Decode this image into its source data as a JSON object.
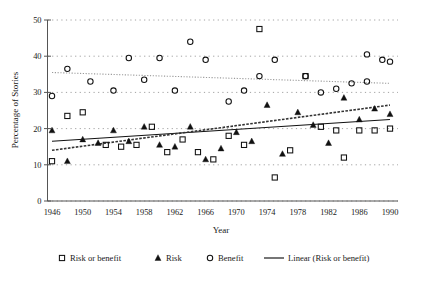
{
  "chart_data": {
    "type": "scatter",
    "title": "",
    "xlabel": "Year",
    "ylabel": "Percentage of Stories",
    "xlim": [
      1945,
      1991
    ],
    "ylim": [
      0,
      50
    ],
    "xticks": [
      1946,
      1950,
      1954,
      1958,
      1962,
      1966,
      1970,
      1974,
      1978,
      1982,
      1986,
      1990
    ],
    "yticks": [
      0,
      10,
      20,
      30,
      40,
      50
    ],
    "grid": true,
    "legend_position": "bottom",
    "series": [
      {
        "name": "Risk or benefit",
        "marker": "open-square",
        "points": [
          [
            1946,
            11.0
          ],
          [
            1948,
            23.5
          ],
          [
            1950,
            24.5
          ],
          [
            1953,
            15.5
          ],
          [
            1955,
            15.0
          ],
          [
            1957,
            15.5
          ],
          [
            1959,
            20.5
          ],
          [
            1961,
            13.5
          ],
          [
            1963,
            17.0
          ],
          [
            1965,
            13.5
          ],
          [
            1967,
            11.5
          ],
          [
            1969,
            18.0
          ],
          [
            1971,
            15.5
          ],
          [
            1973,
            47.5
          ],
          [
            1975,
            6.5
          ],
          [
            1977,
            14.0
          ],
          [
            1979,
            34.5
          ],
          [
            1981,
            20.5
          ],
          [
            1983,
            19.5
          ],
          [
            1984,
            12.0
          ],
          [
            1986,
            19.5
          ],
          [
            1988,
            19.5
          ],
          [
            1990,
            20.0
          ]
        ]
      },
      {
        "name": "Risk",
        "marker": "filled-triangle",
        "points": [
          [
            1946,
            19.5
          ],
          [
            1948,
            11.0
          ],
          [
            1950,
            17.0
          ],
          [
            1952,
            16.0
          ],
          [
            1954,
            19.5
          ],
          [
            1956,
            16.5
          ],
          [
            1958,
            20.5
          ],
          [
            1960,
            15.5
          ],
          [
            1962,
            15.0
          ],
          [
            1964,
            20.5
          ],
          [
            1966,
            11.5
          ],
          [
            1968,
            14.5
          ],
          [
            1970,
            19.0
          ],
          [
            1972,
            16.5
          ],
          [
            1974,
            26.5
          ],
          [
            1976,
            13.0
          ],
          [
            1978,
            24.5
          ],
          [
            1980,
            21.0
          ],
          [
            1982,
            16.0
          ],
          [
            1984,
            28.5
          ],
          [
            1986,
            22.5
          ],
          [
            1988,
            25.5
          ],
          [
            1990,
            24.0
          ]
        ]
      },
      {
        "name": "Benefit",
        "marker": "open-circle",
        "points": [
          [
            1946,
            29.0
          ],
          [
            1948,
            36.5
          ],
          [
            1951,
            33.0
          ],
          [
            1954,
            30.5
          ],
          [
            1956,
            39.5
          ],
          [
            1958,
            33.5
          ],
          [
            1960,
            39.5
          ],
          [
            1962,
            30.5
          ],
          [
            1964,
            44.0
          ],
          [
            1966,
            39.0
          ],
          [
            1969,
            27.5
          ],
          [
            1971,
            30.5
          ],
          [
            1973,
            34.5
          ],
          [
            1975,
            39.0
          ],
          [
            1979,
            34.5
          ],
          [
            1981,
            30.0
          ],
          [
            1983,
            31.0
          ],
          [
            1985,
            32.5
          ],
          [
            1987,
            33.0
          ],
          [
            1987,
            40.5
          ],
          [
            1989,
            39.0
          ],
          [
            1990,
            38.5
          ]
        ]
      }
    ],
    "trendlines": [
      {
        "name": "Linear (Risk or benefit)",
        "style": "solid",
        "x0": 1946,
        "y0": 16.5,
        "x1": 1990,
        "y1": 22.5
      },
      {
        "name": "Linear (Risk)",
        "style": "dashed",
        "x0": 1946,
        "y0": 14.0,
        "x1": 1990,
        "y1": 26.5
      },
      {
        "name": "Linear (Benefit)",
        "style": "dotted",
        "x0": 1946,
        "y0": 35.5,
        "x1": 1990,
        "y1": 32.5
      }
    ]
  },
  "legend": {
    "items": [
      {
        "label": "Risk or benefit",
        "marker": "open-square"
      },
      {
        "label": "Risk",
        "marker": "filled-triangle"
      },
      {
        "label": "Benefit",
        "marker": "open-circle"
      },
      {
        "label": "Linear (Risk or benefit)",
        "marker": "line"
      }
    ]
  },
  "colors": {
    "marker": "#111111",
    "axis": "#555555",
    "grid": "#8a8a8a",
    "background": "#ffffff"
  }
}
